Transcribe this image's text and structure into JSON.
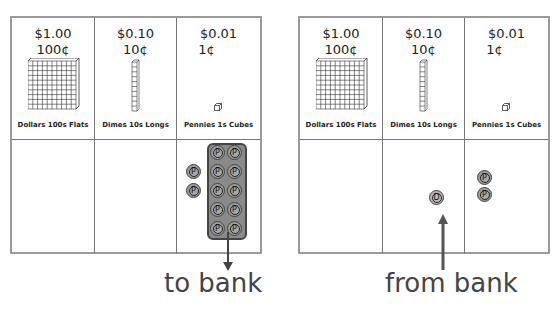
{
  "boards": [
    {
      "id": "left",
      "columns": [
        {
          "value": "$1.00",
          "cents": "100¢",
          "label": "Dollars  100s  Flats",
          "block": "flat"
        },
        {
          "value": "$0.10",
          "cents": "10¢",
          "label": "Dimes  10s  Longs",
          "block": "long"
        },
        {
          "value": "$0.01",
          "cents": "1¢",
          "label": "Pennies  1s  Cubes",
          "block": "cube"
        }
      ],
      "coins": {
        "dollars": [],
        "dimes": [],
        "pennies": [
          "P",
          "P",
          "P",
          "P",
          "P",
          "P",
          "P",
          "P",
          "P",
          "P",
          "P",
          "P"
        ]
      },
      "grouped_pennies": 10,
      "caption": "to bank",
      "arrow": "down"
    },
    {
      "id": "right",
      "columns": [
        {
          "value": "$1.00",
          "cents": "100¢",
          "label": "Dollars  100s  Flats",
          "block": "flat"
        },
        {
          "value": "$0.10",
          "cents": "10¢",
          "label": "Dimes  10s  Longs",
          "block": "long"
        },
        {
          "value": "$0.01",
          "cents": "1¢",
          "label": "Pennies  1s  Cubes",
          "block": "cube"
        }
      ],
      "coins": {
        "dollars": [],
        "dimes": [
          "D"
        ],
        "pennies": [
          "P",
          "P"
        ]
      },
      "caption": "from bank",
      "arrow": "up"
    }
  ],
  "coin_letters": {
    "penny": "P",
    "dime": "D"
  },
  "colors": {
    "coin": "#9b9b9b",
    "border": "#9a9a9a",
    "arrow": "#555555"
  }
}
